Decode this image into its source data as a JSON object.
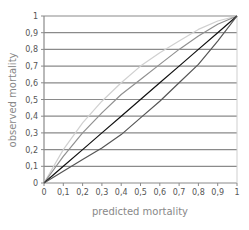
{
  "chart_data": {
    "type": "line",
    "title": "",
    "xlabel": "predicted mortality",
    "ylabel": "observed mortality",
    "xlim": [
      0,
      1
    ],
    "ylim": [
      0,
      1
    ],
    "grid": {
      "horizontal": true,
      "vertical": false
    },
    "legend": null,
    "x_ticks": [
      "0",
      "0,1",
      "0,2",
      "0,3",
      "0,4",
      "0,5",
      "0,6",
      "0,7",
      "0,8",
      "0,9",
      "1"
    ],
    "y_ticks": [
      "0",
      "0,1",
      "0,2",
      "0,3",
      "0,4",
      "0,5",
      "0,6",
      "0,7",
      "0,8",
      "0,9",
      "1"
    ],
    "x": [
      0,
      0.1,
      0.2,
      0.3,
      0.4,
      0.5,
      0.6,
      0.7,
      0.8,
      0.9,
      1
    ],
    "series": [
      {
        "name": "upper curve (light gray)",
        "color": "#d0d0d0",
        "values": [
          0,
          0.2,
          0.36,
          0.49,
          0.6,
          0.7,
          0.78,
          0.85,
          0.92,
          0.97,
          1
        ]
      },
      {
        "name": "upper curve (mid gray)",
        "color": "#909090",
        "values": [
          0,
          0.16,
          0.3,
          0.42,
          0.53,
          0.62,
          0.71,
          0.8,
          0.88,
          0.95,
          1
        ]
      },
      {
        "name": "diagonal (black)",
        "color": "#111111",
        "values": [
          0,
          0.1,
          0.2,
          0.3,
          0.4,
          0.5,
          0.6,
          0.7,
          0.8,
          0.9,
          1
        ]
      },
      {
        "name": "lower curve (dark gray)",
        "color": "#555555",
        "values": [
          0,
          0.07,
          0.14,
          0.21,
          0.29,
          0.39,
          0.49,
          0.6,
          0.71,
          0.85,
          1
        ]
      }
    ]
  }
}
